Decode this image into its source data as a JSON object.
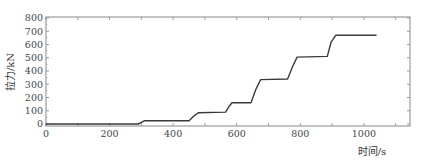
{
  "chart_data": {
    "type": "line",
    "title": "",
    "xlabel": "时间/s",
    "ylabel": "拉力/kN",
    "xlim": [
      0,
      1145
    ],
    "ylim": [
      -10,
      800
    ],
    "xticks": [
      0,
      200,
      400,
      600,
      800,
      1000
    ],
    "yticks": [
      0,
      100,
      200,
      300,
      400,
      500,
      600,
      700,
      800
    ],
    "grid": false,
    "legend": null,
    "series": [
      {
        "name": "拉力",
        "color": "#3a3a3a",
        "x": [
          0,
          290,
          300,
          310,
          450,
          465,
          480,
          565,
          575,
          585,
          645,
          660,
          675,
          760,
          775,
          790,
          885,
          897,
          912,
          1040
        ],
        "y": [
          0,
          0,
          12,
          25,
          25,
          60,
          85,
          90,
          130,
          160,
          160,
          260,
          335,
          340,
          430,
          505,
          510,
          620,
          670,
          670
        ]
      }
    ]
  }
}
